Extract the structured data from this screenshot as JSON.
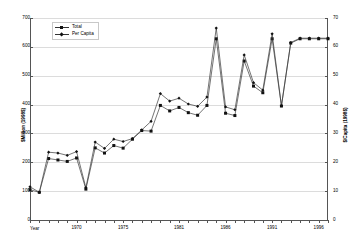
{
  "chart_data": {
    "type": "line",
    "title": "",
    "xlabel": "Year",
    "ylabel": "$Million (1998$)",
    "y2label": "$/Capita (1998$)",
    "ylim": [
      0,
      700
    ],
    "y2lim": [
      0,
      70
    ],
    "ytick_labels": [
      "0",
      "100",
      "200",
      "300",
      "400",
      "500",
      "600",
      "700"
    ],
    "y2tick_labels": [
      "0",
      "10",
      "20",
      "30",
      "40",
      "50",
      "60",
      "70"
    ],
    "grid": true,
    "legend_position": "upper left",
    "x": [
      1965,
      1966,
      1967,
      1968,
      1969,
      1970,
      1971,
      1972,
      1973,
      1974,
      1975,
      1976,
      1977,
      1978,
      1979,
      1980,
      1981,
      1982,
      1983,
      1984,
      1985,
      1986,
      1987,
      1988,
      1989,
      1990,
      1991,
      1992,
      1993,
      1994,
      1995,
      1996,
      1997
    ],
    "xtick_labels": [
      "1970",
      "1975",
      "1981",
      "1986",
      "1991",
      "1996"
    ],
    "xtick_values": [
      1970,
      1975,
      1981,
      1986,
      1991,
      1996
    ],
    "series": [
      {
        "name": "Total",
        "axis": "left",
        "marker": "square",
        "values": [
          105,
          96,
          213,
          208,
          203,
          215,
          107,
          250,
          232,
          258,
          249,
          280,
          310,
          308,
          397,
          378,
          390,
          372,
          363,
          397,
          628,
          370,
          362,
          551,
          464,
          441,
          628,
          395,
          613,
          628,
          628,
          628,
          628
        ]
      },
      {
        "name": "Per Capita",
        "axis": "right",
        "marker": "diamond",
        "values": [
          11.5,
          9.6,
          23.5,
          23.2,
          22.4,
          23.7,
          11.2,
          27.0,
          24.8,
          28.0,
          27.2,
          28.2,
          31.2,
          34.2,
          43.8,
          41.2,
          42.2,
          40.2,
          39.4,
          42.6,
          66.5,
          39.2,
          38.2,
          57.2,
          47.6,
          45.0,
          64.5,
          39.6,
          61.5,
          63.0,
          63.0,
          63.0,
          63.0
        ]
      }
    ]
  },
  "legend": {
    "items": [
      {
        "label": "Total",
        "marker": "square"
      },
      {
        "label": "Per Capita",
        "marker": "diamond"
      }
    ]
  },
  "axes": {
    "x_title": "Year",
    "y_left_title": "$Million (1998$)",
    "y_right_title": "$/Capita (1998$)"
  }
}
